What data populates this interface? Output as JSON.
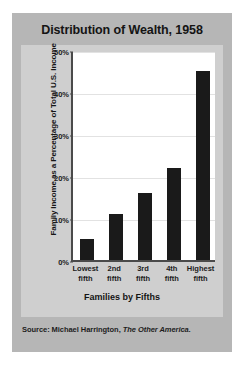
{
  "figure": {
    "title": "Distribution of Wealth, 1958",
    "source_prefix": "Source: Michael Harrington,",
    "source_book": "The Other America."
  },
  "chart_data": {
    "type": "bar",
    "title": "Distribution of Wealth, 1958",
    "xlabel": "Families by Fifths",
    "ylabel": "Family Income as a Percentage of Total U.S. Income",
    "categories": [
      "Lowest fifth",
      "2nd fifth",
      "3rd fifth",
      "4th fifth",
      "Highest fifth"
    ],
    "category_lines": [
      [
        "Lowest",
        "fifth"
      ],
      [
        "2nd",
        "fifth"
      ],
      [
        "3rd",
        "fifth"
      ],
      [
        "4th",
        "fifth"
      ],
      [
        "Highest",
        "fifth"
      ]
    ],
    "values": [
      5,
      11,
      16,
      22,
      45
    ],
    "ylim": [
      0,
      50
    ],
    "yticks": [
      0,
      10,
      20,
      30,
      40,
      50
    ],
    "ytick_labels": [
      "0%",
      "10%",
      "20%",
      "30%",
      "40%",
      "50%"
    ],
    "grid": true,
    "legend": "none",
    "bar_color": "#1a1a1a",
    "plot_background": "#ffffff",
    "panel_background": "#cfcfcf",
    "card_background": "#b6b6b6"
  }
}
